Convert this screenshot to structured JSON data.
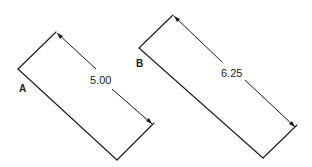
{
  "diagram": {
    "shapes": [
      {
        "id": "A",
        "label": "A",
        "dimension": "5.00"
      },
      {
        "id": "B",
        "label": "B",
        "dimension": "6.25"
      }
    ]
  }
}
